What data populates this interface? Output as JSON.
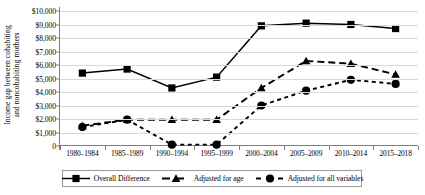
{
  "chart_data": {
    "type": "line",
    "title": "",
    "xlabel": "",
    "ylabel": "Income gap between cohabiting and noncohabiting mothers",
    "ylabel_line1": "Income gap between cohabiting",
    "ylabel_line2": "and noncohabiting mothers",
    "categories": [
      "1980–1984",
      "1985–1989",
      "1990–1994",
      "1995–1999",
      "2000–2004",
      "2005–2009",
      "2010–2014",
      "2015–2018"
    ],
    "ylim": [
      0,
      10000
    ],
    "ytick_values": [
      0,
      1000,
      2000,
      3000,
      4000,
      5000,
      6000,
      7000,
      8000,
      9000,
      10000
    ],
    "ytick_labels": [
      "0",
      "$1,000",
      "$2,000",
      "$3,000",
      "$4,000",
      "$5,000",
      "$6,000",
      "$7,000",
      "$8,000",
      "$9,000",
      "$10,000"
    ],
    "grid": true,
    "legend_position": "bottom",
    "series": [
      {
        "name": "Overall Difference",
        "marker": "square",
        "linestyle": "solid",
        "color": "#000000",
        "values": [
          5400,
          5700,
          4300,
          5100,
          8900,
          9100,
          9000,
          8700
        ]
      },
      {
        "name": "Adjusted for age",
        "marker": "triangle",
        "linestyle": "dashed",
        "color": "#000000",
        "values": [
          1500,
          1950,
          1950,
          1950,
          4300,
          6300,
          6100,
          5300
        ]
      },
      {
        "name": "Adjusted for all variables",
        "marker": "circle",
        "linestyle": "dotted",
        "color": "#000000",
        "values": [
          1400,
          1950,
          100,
          100,
          3000,
          4100,
          4900,
          4600
        ]
      }
    ]
  },
  "legend": {
    "items": [
      {
        "label": "Overall Difference",
        "marker": "square-marker-icon",
        "linestyle": "solid"
      },
      {
        "label": "Adjusted for age",
        "marker": "triangle-marker-icon",
        "linestyle": "dashed"
      },
      {
        "label": "Adjusted for all variables",
        "marker": "circle-marker-icon",
        "linestyle": "dotted"
      }
    ]
  }
}
